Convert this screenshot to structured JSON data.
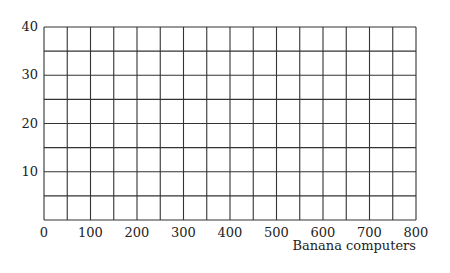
{
  "chart_data": {
    "type": "line",
    "title": "",
    "xlabel": "Banana computers",
    "ylabel": "",
    "xlim": [
      0,
      800
    ],
    "ylim": [
      0,
      40
    ],
    "x_ticks": [
      0,
      100,
      200,
      300,
      400,
      500,
      600,
      700,
      800
    ],
    "y_ticks": [
      10,
      20,
      30,
      40
    ],
    "x_grid_step": 50,
    "y_grid_step": 5,
    "grid": true,
    "series": [],
    "colors": {
      "grid": "#333333",
      "text": "#222222",
      "background": "#ffffff"
    }
  },
  "plot_area": {
    "left": 44,
    "top": 27,
    "right": 416,
    "bottom": 220
  }
}
